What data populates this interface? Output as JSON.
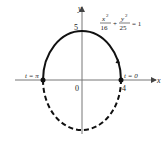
{
  "diagram": {
    "equation": {
      "x_num": "x",
      "x_exp": "2",
      "x_den": "16",
      "plus": "+",
      "y_num": "y",
      "y_exp": "2",
      "y_den": "25",
      "equals": "= 1"
    },
    "axes": {
      "x_label": "x",
      "y_label": "y",
      "origin_label": "0",
      "x_tick_label": "4",
      "y_tick_label": "5"
    },
    "points": {
      "left_label": "t = π",
      "right_label": "t = 0"
    },
    "ellipse": {
      "a": 4,
      "b": 5,
      "upper_style": "solid",
      "lower_style": "dashed",
      "direction": "counterclockwise"
    },
    "colors": {
      "curve": "#111111",
      "axis": "#666666"
    }
  }
}
